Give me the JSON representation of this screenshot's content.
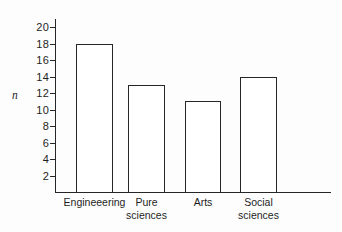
{
  "chart_data": {
    "type": "bar",
    "title": "",
    "subtitle": "",
    "xlabel": "",
    "ylabel": "n",
    "categories": [
      "Engineeering",
      "Pure sciences",
      "Arts",
      "Social sciences"
    ],
    "values": [
      18,
      13,
      11,
      14
    ],
    "ylim": [
      0,
      21
    ],
    "yticks": [
      2,
      4,
      6,
      8,
      10,
      12,
      14,
      16,
      18,
      20
    ],
    "ytick_labels": [
      "2",
      "4",
      "6",
      "8",
      "10",
      "12",
      "14",
      "16",
      "18",
      "20"
    ],
    "grid": false,
    "legend": "none",
    "bar_style": {
      "fill": "#ffffff",
      "edge_color": "#262626",
      "edge_width": 1.3
    },
    "axis_color": "#262626",
    "background": "#fdfdfd",
    "category_label_lines": [
      [
        "Engineeering"
      ],
      [
        "Pure",
        "sciences"
      ],
      [
        "Arts"
      ],
      [
        "Social",
        "sciences"
      ]
    ]
  },
  "figure": {
    "y_axis_name": "n"
  }
}
